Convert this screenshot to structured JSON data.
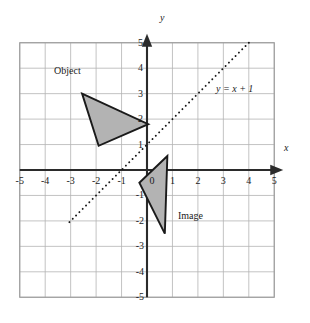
{
  "figure": {
    "top_artifact": "g",
    "frame_color": "#9a9a9a",
    "grid_color": "#b4b4b4",
    "axis_color": "#2b2b2b",
    "shape_fill": "#b3b3b3",
    "shape_stroke": "#1a1a1a",
    "line_color": "#1a1a1a",
    "background": "#ffffff"
  },
  "axes": {
    "x_name": "x",
    "y_name": "y",
    "xlim": [
      -5,
      5
    ],
    "ylim": [
      -5,
      5
    ],
    "grid": true,
    "x_tick_labels": [
      "-5",
      "-4",
      "-3",
      "-2",
      "-1",
      "0",
      "1",
      "2",
      "3",
      "4",
      "5"
    ],
    "y_tick_labels": [
      "5",
      "4",
      "3",
      "2",
      "1",
      "-1",
      "-2",
      "-3",
      "-4",
      "-5"
    ],
    "x_ticks": [
      -5,
      -4,
      -3,
      -2,
      -1,
      0,
      1,
      2,
      3,
      4,
      5
    ],
    "y_ticks_positive": [
      5,
      4,
      3,
      2,
      1
    ],
    "y_ticks_negative": [
      -1,
      -2,
      -3,
      -4,
      -5
    ]
  },
  "annotations": {
    "object_label": "Object",
    "image_label": "Image",
    "line_equation": "y = x + 1"
  },
  "chart_data": {
    "type": "scatter",
    "title": "",
    "xlabel": "x",
    "ylabel": "y",
    "xlim": [
      -5,
      5
    ],
    "ylim": [
      -5,
      5
    ],
    "grid": true,
    "legend": "none",
    "mirror_line": {
      "label": "y = x + 1",
      "slope": 1,
      "intercept": 1,
      "style": "dotted",
      "x_start": -3.05,
      "x_end": 4.05,
      "y_start": -2.05,
      "y_end": 5.05
    },
    "shapes": [
      {
        "name": "Object",
        "type": "triangle",
        "fill": "#b3b3b3",
        "stroke": "#1a1a1a",
        "vertices": [
          [
            -2.55,
            3.0
          ],
          [
            0.05,
            1.8
          ],
          [
            -1.9,
            0.95
          ]
        ],
        "label": "Object",
        "label_position": [
          -3.45,
          3.35
        ]
      },
      {
        "name": "Image",
        "type": "triangle",
        "fill": "#b3b3b3",
        "stroke": "#1a1a1a",
        "vertices": [
          [
            0.8,
            0.55
          ],
          [
            -0.3,
            -0.5
          ],
          [
            0.7,
            -2.5
          ]
        ],
        "label": "Image",
        "label_position": [
          1.25,
          -2.05
        ]
      }
    ]
  }
}
